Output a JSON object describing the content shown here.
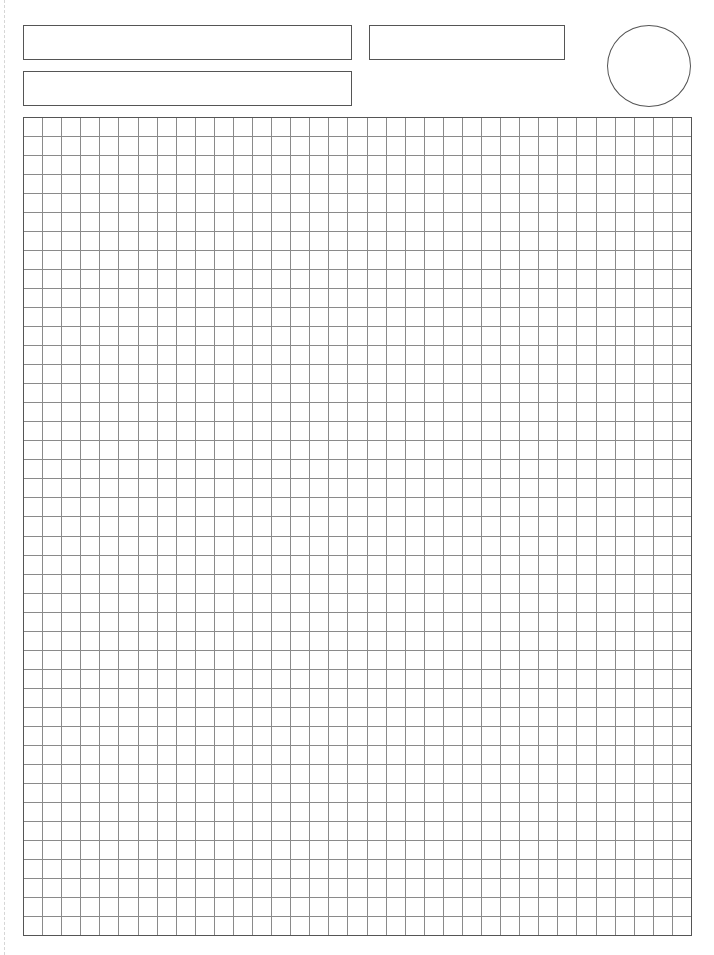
{
  "page": {
    "type": "grid-paper-worksheet",
    "width": 714,
    "height": 955
  },
  "header": {
    "fields": [
      {
        "id": "box-1",
        "label": ""
      },
      {
        "id": "box-2",
        "label": ""
      },
      {
        "id": "box-3",
        "label": ""
      }
    ],
    "circle": {
      "label": ""
    }
  },
  "grid": {
    "columns": 35,
    "rows": 43,
    "cell_size": 19.08,
    "line_color": "#8a8a8a",
    "border_color": "#555555"
  },
  "colors": {
    "background": "#ffffff",
    "box_border": "#555555",
    "fold_mark": "#d6d6d6"
  }
}
